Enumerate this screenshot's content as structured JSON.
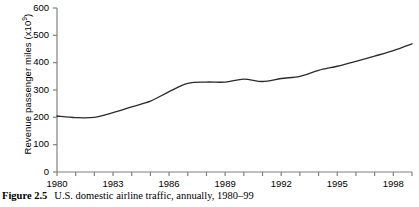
{
  "caption": {
    "label": "Figure 2.5",
    "text": "U.S. domestic airline traffic, annually, 1980–99"
  },
  "axis": {
    "y_title_main": "Revenue passenger miles (x10",
    "y_title_sup": "9",
    "y_title_close": ")",
    "y_ticks": [
      "0",
      "100",
      "200",
      "300",
      "400",
      "500",
      "600"
    ],
    "x_ticks": [
      "1980",
      "1983",
      "1986",
      "1989",
      "1992",
      "1995",
      "1998"
    ]
  },
  "style": {
    "line_color": "#2b2b2b",
    "axis_color": "#808080",
    "background": "#ffffff"
  },
  "chart_data": {
    "type": "line",
    "title": "",
    "subtitle": "",
    "xlabel": "",
    "ylabel": "Revenue passenger miles (x10^9)",
    "xlim": [
      1980,
      1999
    ],
    "ylim": [
      0,
      600
    ],
    "ytick_interval": 100,
    "xtick_interval_minor": 1,
    "xtick_interval_major": 3,
    "grid": false,
    "legend": null,
    "x": [
      1980,
      1981,
      1982,
      1983,
      1984,
      1985,
      1986,
      1987,
      1988,
      1989,
      1990,
      1991,
      1992,
      1993,
      1994,
      1995,
      1996,
      1997,
      1998,
      1999
    ],
    "series": [
      {
        "name": "U.S. domestic revenue passenger miles",
        "values": [
          205,
          199,
          200,
          217,
          238,
          259,
          294,
          324,
          329,
          329,
          340,
          331,
          342,
          350,
          372,
          387,
          405,
          424,
          444,
          469
        ]
      }
    ]
  }
}
